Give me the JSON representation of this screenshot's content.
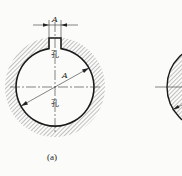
{
  "figure_a": {
    "caption": "(a)",
    "keyway_width_label": "A",
    "diameter_label": "A",
    "hole_label_top": "孔",
    "hole_label_bottom": "孔",
    "description": "Hatched bore with keyway notch at top; dimensioned keyway width A and diameter A"
  },
  "figure_b": {
    "description": "Hatched solid shaft cross-section (partially visible, cropped at right edge)"
  },
  "colors": {
    "line": "#1a1a1a",
    "hatch": "#555555",
    "background": "#fbfbfa"
  }
}
